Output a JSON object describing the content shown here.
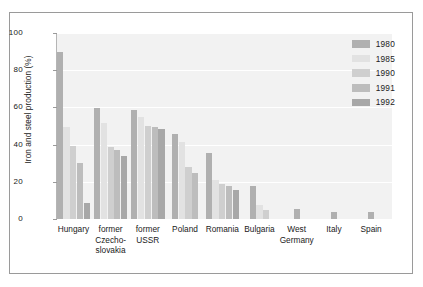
{
  "chart_data": {
    "type": "bar",
    "title": "",
    "xlabel": "",
    "ylabel": "Iron and steel production (%)",
    "ylim": [
      0,
      100
    ],
    "yticks": [
      0,
      20,
      40,
      60,
      80,
      100
    ],
    "grid": true,
    "legend_position": "top-right",
    "categories": [
      "Hungary",
      "former\nCzecho-\nslovakia",
      "former\nUSSR",
      "Poland",
      "Romania",
      "Bulgaria",
      "West\nGermany",
      "Italy",
      "Spain"
    ],
    "series": [
      {
        "name": "1980",
        "color": "#b0b0b0",
        "values": [
          90,
          59.5,
          58.5,
          45.5,
          35.5,
          17.5,
          5.5,
          4,
          4
        ]
      },
      {
        "name": "1985",
        "color": "#e2e2e2",
        "values": [
          49.5,
          51.5,
          55,
          41.5,
          21,
          7.5,
          null,
          null,
          null
        ]
      },
      {
        "name": "1990",
        "color": "#cfcfcf",
        "values": [
          39,
          38.5,
          50,
          28,
          19,
          5,
          null,
          null,
          null
        ]
      },
      {
        "name": "1991",
        "color": "#bdbdbd",
        "values": [
          30,
          37,
          49.5,
          24.5,
          17.5,
          null,
          null,
          null,
          null
        ]
      },
      {
        "name": "1992",
        "color": "#a8a8a8",
        "values": [
          8.5,
          34,
          48.5,
          null,
          15.5,
          null,
          null,
          null,
          null
        ]
      }
    ]
  },
  "legend": {
    "items": [
      {
        "label": "1980"
      },
      {
        "label": "1985"
      },
      {
        "label": "1990"
      },
      {
        "label": "1991"
      },
      {
        "label": "1992"
      }
    ]
  },
  "axis": {
    "y_tick_labels": [
      "100",
      "80",
      "60",
      "40",
      "20",
      "0"
    ],
    "y_axis_title": "Iron and steel production (%)"
  },
  "colors": {
    "plot_background": "#f2f2f2",
    "gridline": "#ffffff",
    "frame": "#9a9a9a",
    "text": "#1a1a1a"
  }
}
